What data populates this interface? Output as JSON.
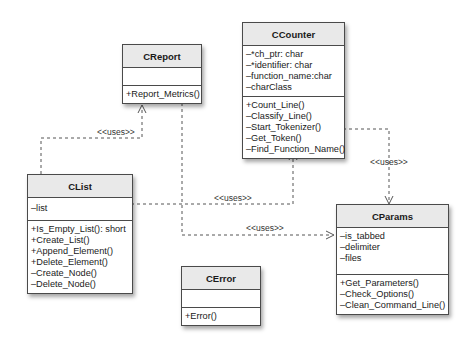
{
  "diagram": {
    "type": "UML class diagram",
    "classes": {
      "counter": {
        "name": "CCounter",
        "attributes": [
          "–*ch_ptr: char",
          "–*identifier: char",
          "–function_name:char",
          "–charClass"
        ],
        "methods": [
          "+Count_Line()",
          "–Classify_Line()",
          "–Start_Tokenizer()",
          "–Get_Token()",
          "–Find_Function_Name()"
        ]
      },
      "report": {
        "name": "CReport",
        "attributes": [],
        "methods": [
          "+Report_Metrics()"
        ]
      },
      "list": {
        "name": "CList",
        "attributes": [
          "–list"
        ],
        "methods": [
          "+Is_Empty_List(): short",
          "+Create_List()",
          "+Append_Element()",
          "+Delete_Element()",
          "–Create_Node()",
          "–Delete_Node()"
        ]
      },
      "params": {
        "name": "CParams",
        "attributes": [
          "–is_tabbed",
          "–delimiter",
          "–files"
        ],
        "methods": [
          "+Get_Parameters()",
          "–Check_Options()",
          "–Clean_Command_Line()"
        ]
      },
      "error": {
        "name": "CError",
        "attributes": [],
        "methods": [
          "+Error()"
        ]
      }
    },
    "relationships": [
      {
        "from": "CList",
        "to": "CReport",
        "label": "<<uses>>",
        "style": "dashed-arrow"
      },
      {
        "from": "CList",
        "to": "CCounter",
        "label": "<<uses>>",
        "style": "dashed-arrow"
      },
      {
        "from": "CCounter",
        "to": "CParams",
        "label": "<<uses>>",
        "style": "dashed-arrow"
      },
      {
        "from": "CReport",
        "to": "CParams",
        "label": "<<uses>>",
        "style": "dashed-arrow"
      }
    ],
    "labels": {
      "uses_list_report": "<<uses>>",
      "uses_list_counter": "<<uses>>",
      "uses_counter_params": "<<uses>>",
      "uses_report_params": "<<uses>>"
    },
    "colors": {
      "header_fill": "#e9e9e9",
      "border": "#4a4a4a",
      "line": "#555555"
    }
  }
}
